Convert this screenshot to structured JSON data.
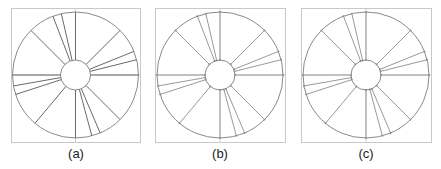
{
  "figure": {
    "panels": [
      {
        "id": "a",
        "label": "(a)",
        "box": {
          "x": 11,
          "y": 8,
          "w": 129,
          "h": 134
        },
        "center": {
          "x": 75.5,
          "y": 75
        },
        "outer_radius": 63,
        "inner_radius": 15,
        "style": "dark",
        "spoke_angles_deg": [
          0,
          -13,
          -21,
          -45,
          -90,
          -100,
          -108,
          -140,
          180,
          165,
          157,
          135,
          90,
          76,
          68,
          45
        ]
      },
      {
        "id": "b",
        "label": "(b)",
        "box": {
          "x": 155,
          "y": 8,
          "w": 130,
          "h": 134
        },
        "center": {
          "x": 220,
          "y": 75
        },
        "outer_radius": 63,
        "inner_radius": 15,
        "style": "light",
        "spoke_angles_deg": [
          0,
          -13,
          -21,
          -45,
          -90,
          -100,
          -108,
          -140,
          180,
          165,
          157,
          135,
          90,
          76,
          68,
          45
        ]
      },
      {
        "id": "c",
        "label": "(c)",
        "box": {
          "x": 301,
          "y": 8,
          "w": 130,
          "h": 134
        },
        "center": {
          "x": 366,
          "y": 75
        },
        "outer_radius": 63,
        "inner_radius": 15,
        "style": "light",
        "spoke_angles_deg": [
          0,
          -13,
          -21,
          -45,
          -90,
          -100,
          -108,
          -140,
          180,
          165,
          157,
          135,
          90,
          76,
          68,
          45
        ]
      }
    ],
    "colors": {
      "box": "#c8c8c8",
      "circle": "#8a8a8a",
      "spoke_dark": "#6a6a6a",
      "spoke_light": "#9a9a9a",
      "axis": "#d0d0d0"
    }
  }
}
